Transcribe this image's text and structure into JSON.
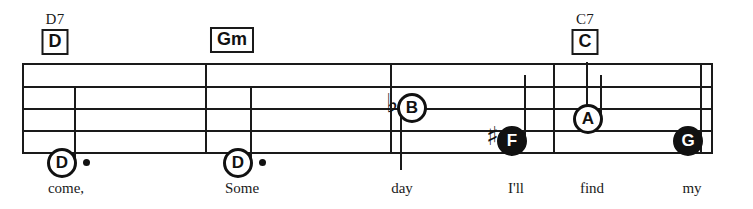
{
  "sheet": {
    "width": 753,
    "height": 209,
    "background": "#ffffff",
    "ink_color": "#1a1a1a"
  },
  "staff": {
    "left": 22,
    "right": 712,
    "line_ys": [
      63,
      86,
      108,
      130,
      152
    ],
    "barline_xs": [
      205,
      390,
      553,
      700,
      711
    ]
  },
  "chords": [
    {
      "alt_label": "D7",
      "box_label": "D",
      "x": 55
    },
    {
      "alt_label": "",
      "box_label": "Gm",
      "x": 232
    },
    {
      "alt_label": "C7",
      "box_label": "C",
      "x": 585
    }
  ],
  "notes": [
    {
      "letter": "D",
      "style": "hollow",
      "accidental": "",
      "dotted": true,
      "x": 62,
      "y": 163,
      "stem": "up",
      "lyric": "come,"
    },
    {
      "letter": "D",
      "style": "hollow",
      "accidental": "",
      "dotted": true,
      "x": 238,
      "y": 163,
      "stem": "up",
      "lyric": "Some"
    },
    {
      "letter": "B",
      "style": "hollow",
      "accidental": "♭",
      "dotted": false,
      "x": 412,
      "y": 108,
      "stem": "down",
      "lyric": "day"
    },
    {
      "letter": "F",
      "style": "filled",
      "accidental": "♯",
      "dotted": false,
      "x": 512,
      "y": 141,
      "stem": "up",
      "lyric": "I'll"
    },
    {
      "letter": "A",
      "style": "hollow",
      "accidental": "",
      "dotted": false,
      "x": 588,
      "y": 119,
      "stem": "up",
      "lyric": "find"
    },
    {
      "letter": "G",
      "style": "filled",
      "accidental": "",
      "dotted": false,
      "x": 688,
      "y": 141,
      "stem": "none",
      "lyric": "my"
    }
  ],
  "lyrics_baseline_y": 180
}
